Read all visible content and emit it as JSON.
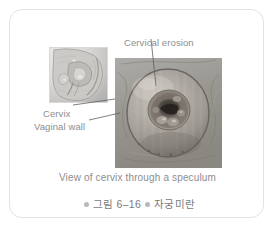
{
  "figure": {
    "labels": {
      "cervical_erosion": "Cervical erosion",
      "cervix": "Cervix",
      "vaginal_wall": "Vaginal wall"
    },
    "caption_english": "View of cervix through a speculum",
    "caption_korean": {
      "figure_number": "그림 6–16",
      "title": "자궁미란"
    },
    "images": {
      "inset_alt": "sagittal-cross-section-of-female-pelvis",
      "main_alt": "cervix-viewed-through-speculum"
    },
    "colors": {
      "card_border": "#e2e2e2",
      "label_text": "#8d8d8d",
      "caption_text": "#7a7a7a",
      "bullet": "#b8b8b8",
      "leader_line": "#5f5f5f"
    }
  }
}
